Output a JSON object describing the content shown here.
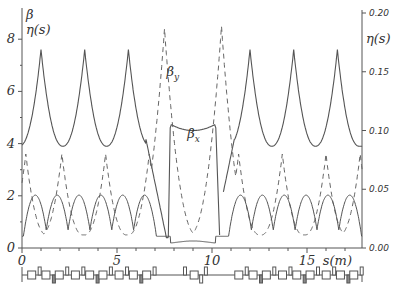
{
  "chart_data": {
    "type": "line",
    "title": "",
    "xlabel": "s(m)",
    "ylabel_left": "β η(s)",
    "ylabel_left_lines": [
      "β",
      "η(s)"
    ],
    "ylabel_right": "η(s)",
    "xlim": [
      0,
      17.9
    ],
    "ylim_left": [
      0,
      8.5
    ],
    "ylim_right": [
      0,
      0.2
    ],
    "x_ticks": [
      0,
      5,
      10,
      15
    ],
    "x_tick_labels": [
      "0",
      "5",
      "10",
      "15"
    ],
    "y_ticks_left": [
      0,
      2,
      4,
      6,
      8
    ],
    "y_tick_labels_left": [
      "0",
      "2",
      "4",
      "6",
      "8"
    ],
    "y_ticks_right": [
      0.0,
      0.05,
      0.1,
      0.15,
      0.2
    ],
    "y_tick_labels_right": [
      "0.00",
      "0.05",
      "0.10",
      "0.15",
      "0.20"
    ],
    "grid": false,
    "annotations": [
      {
        "text": "β",
        "sub": "y",
        "x": 7.6,
        "y": 6.6
      },
      {
        "text": "β",
        "sub": "x",
        "x": 8.7,
        "y": 4.2
      }
    ],
    "series": [
      {
        "name": "beta_x",
        "style": "solid",
        "description": "periodic peaks ~7.6 at cell centers, minima ~3.9; flat ~4.5 in straight section s≈7.8-10.2"
      },
      {
        "name": "beta_y",
        "style": "dashed",
        "description": "periodic peaks ~3.6, minima ~0.5; large peaks ~8.4 at s≈7.5 and s≈10.5"
      },
      {
        "name": "eta",
        "style": "solid",
        "axis": "right",
        "description": "periodic arcs 0.01-0.045; near 0.005 in straight section"
      }
    ],
    "beta_x_peaks": [
      [
        1.0,
        7.6
      ],
      [
        3.3,
        7.6
      ],
      [
        5.6,
        7.5
      ],
      [
        12.0,
        7.6
      ],
      [
        14.3,
        7.6
      ],
      [
        16.6,
        7.6
      ]
    ],
    "beta_y_peaks": [
      [
        0.2,
        3.6
      ],
      [
        2.1,
        3.6
      ],
      [
        4.4,
        3.6
      ],
      [
        6.7,
        3.6
      ],
      [
        7.5,
        8.4
      ],
      [
        10.5,
        8.5
      ],
      [
        11.4,
        3.6
      ],
      [
        13.7,
        3.6
      ],
      [
        16.0,
        3.6
      ],
      [
        17.8,
        3.6
      ]
    ],
    "straight_section": {
      "start": 7.8,
      "end": 10.2,
      "beta_x": 4.5,
      "eta": 0.005
    },
    "cell_period_m": 2.33,
    "lattice_strip": "magnet element layout: dipoles (boxes) and quadrupoles (bars) along s"
  }
}
